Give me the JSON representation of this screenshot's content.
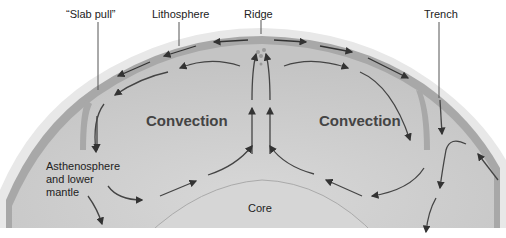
{
  "diagram": {
    "type": "cross-section",
    "labels": {
      "slab_pull": "“Slab pull”",
      "lithosphere": "Lithosphere",
      "ridge": "Ridge",
      "trench": "Trench",
      "convection_left": "Convection",
      "convection_right": "Convection",
      "asthenosphere_line1": "Asthenosphere",
      "asthenosphere_line2": "and lower",
      "asthenosphere_line3": "mantle",
      "core": "Core"
    },
    "colors": {
      "background": "#ffffff",
      "mantle": "#c9c9c9",
      "lithosphere": "#a6a6a6",
      "core": "#d4d4d4",
      "arrows": "#333333",
      "halo": "#e6e6e6"
    }
  }
}
